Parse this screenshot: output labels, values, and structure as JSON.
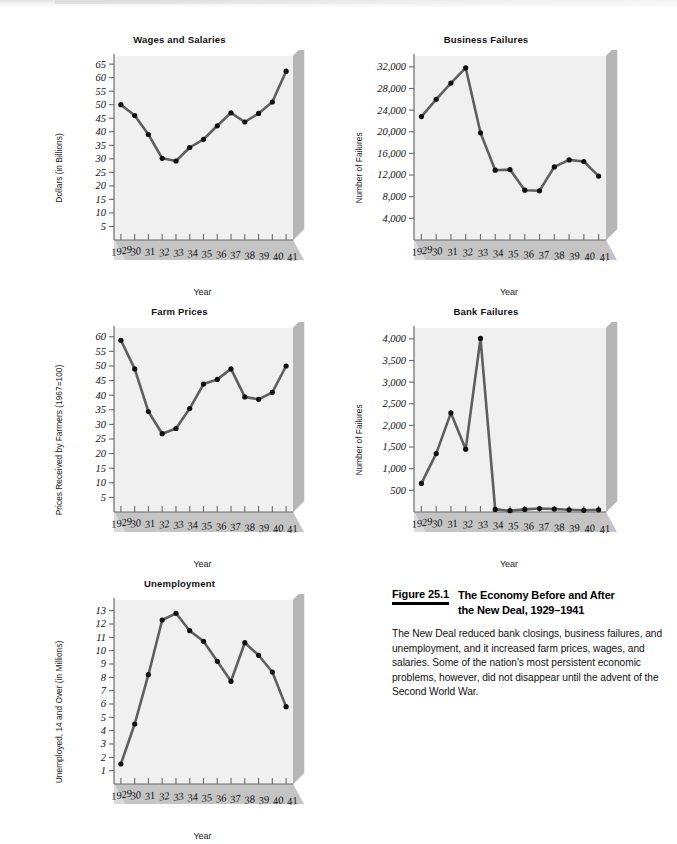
{
  "document": {
    "kind": "textbook-figure-page"
  },
  "figure": {
    "number_label": "Figure 25.1",
    "title_line1": "The Economy Before and After",
    "title_line2": "the New Deal, 1929–1941",
    "body": "The New Deal reduced bank closings, business failures, and unemployment, and it increased farm prices, wages, and salaries. Some of the nation's most persistent economic problems, however, did not disappear until the advent of the Second World War."
  },
  "style": {
    "plot_bg": "#f0f0f0",
    "shadow_side": "#b6b6b6",
    "shadow_bottom": "#c4c4c4",
    "line_color": "#5f5f5f",
    "marker_color": "#101010",
    "axis_color": "#6a6a6a",
    "text_color": "#111111"
  },
  "xlabel_shared": "Year",
  "categories": [
    "1929",
    "30",
    "31",
    "32",
    "33",
    "34",
    "35",
    "36",
    "37",
    "38",
    "39",
    "40",
    "41"
  ],
  "chart_data": [
    {
      "id": "wages-and-salaries",
      "type": "line",
      "title": "Wages and Salaries",
      "xlabel": "Year",
      "ylabel": "Dollars (in Billions)",
      "categories": [
        "1929",
        "30",
        "31",
        "32",
        "33",
        "34",
        "35",
        "36",
        "37",
        "38",
        "39",
        "40",
        "41"
      ],
      "values": [
        50.0,
        46.0,
        39.0,
        30.2,
        29.2,
        34.2,
        37.2,
        42.2,
        47.0,
        43.6,
        46.8,
        51.0,
        62.4
      ],
      "yticks": [
        5,
        10,
        15,
        20,
        25,
        30,
        35,
        40,
        45,
        50,
        55,
        60,
        65
      ],
      "ylim": [
        0,
        68
      ],
      "grid": false,
      "legend": "none"
    },
    {
      "id": "business-failures",
      "type": "line",
      "title": "Business Failures",
      "xlabel": "Year",
      "ylabel": "Number of Failures",
      "categories": [
        "1929",
        "30",
        "31",
        "32",
        "33",
        "34",
        "35",
        "36",
        "37",
        "38",
        "39",
        "40",
        "41"
      ],
      "values": [
        22800,
        26000,
        29000,
        31800,
        19800,
        12900,
        13000,
        9200,
        9100,
        13500,
        14800,
        14500,
        11800
      ],
      "yticks": [
        4000,
        8000,
        12000,
        16000,
        20000,
        24000,
        28000,
        32000
      ],
      "ytick_labels": [
        "4,000",
        "8,000",
        "12,000",
        "16,000",
        "20,000",
        "24,000",
        "28,000",
        "32,000"
      ],
      "ylim": [
        0,
        34000
      ],
      "grid": false,
      "legend": "none"
    },
    {
      "id": "farm-prices",
      "type": "line",
      "title": "Farm Prices",
      "xlabel": "Year",
      "ylabel": "Prices Received by Farmers (1967=100)",
      "categories": [
        "1929",
        "30",
        "31",
        "32",
        "33",
        "34",
        "35",
        "36",
        "37",
        "38",
        "39",
        "40",
        "41"
      ],
      "values": [
        58.8,
        49.0,
        34.4,
        26.8,
        28.6,
        35.4,
        43.8,
        45.4,
        49.0,
        39.4,
        38.6,
        41.0,
        50.0
      ],
      "yticks": [
        5,
        10,
        15,
        20,
        25,
        30,
        35,
        40,
        45,
        50,
        55,
        60
      ],
      "ylim": [
        0,
        63
      ],
      "grid": false,
      "legend": "none"
    },
    {
      "id": "bank-failures",
      "type": "line",
      "title": "Bank Failures",
      "xlabel": "Year",
      "ylabel": "Number of Failures",
      "categories": [
        "1929",
        "30",
        "31",
        "32",
        "33",
        "34",
        "35",
        "36",
        "37",
        "38",
        "39",
        "40",
        "41"
      ],
      "values": [
        660,
        1350,
        2290,
        1450,
        4010,
        60,
        30,
        60,
        80,
        70,
        50,
        40,
        50
      ],
      "yticks": [
        500,
        1000,
        1500,
        2000,
        2500,
        3000,
        3500,
        4000
      ],
      "ytick_labels": [
        "500",
        "1,000",
        "1,500",
        "2,000",
        "2,500",
        "3,000",
        "3,500",
        "4,000"
      ],
      "ylim": [
        0,
        4250
      ],
      "grid": false,
      "legend": "none"
    },
    {
      "id": "unemployment",
      "type": "line",
      "title": "Unemployment",
      "xlabel": "Year",
      "ylabel": "Unemployed, 14 and Over (in Millions)",
      "categories": [
        "1929",
        "30",
        "31",
        "32",
        "33",
        "34",
        "35",
        "36",
        "37",
        "38",
        "39",
        "40",
        "41"
      ],
      "values": [
        1.5,
        4.5,
        8.2,
        12.3,
        12.8,
        11.5,
        10.7,
        9.2,
        7.7,
        10.6,
        9.65,
        8.4,
        5.8
      ],
      "yticks": [
        1,
        2,
        3,
        4,
        5,
        6,
        7,
        8,
        9,
        10,
        11,
        12,
        13
      ],
      "ylim": [
        0,
        13.8
      ],
      "grid": false,
      "legend": "none"
    }
  ],
  "panel_layout": [
    {
      "id": "wages-and-salaries",
      "left": 52,
      "top": 6,
      "w": 255,
      "h": 236
    },
    {
      "id": "business-failures",
      "left": 352,
      "top": 6,
      "w": 268,
      "h": 236
    },
    {
      "id": "farm-prices",
      "left": 52,
      "top": 278,
      "w": 255,
      "h": 236
    },
    {
      "id": "bank-failures",
      "left": 352,
      "top": 278,
      "w": 268,
      "h": 236
    },
    {
      "id": "unemployment",
      "left": 52,
      "top": 550,
      "w": 255,
      "h": 236
    }
  ]
}
